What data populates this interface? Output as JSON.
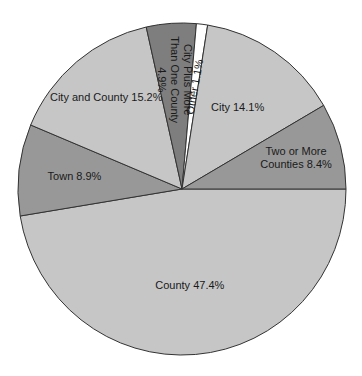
{
  "chart_data": {
    "type": "pie",
    "title": "",
    "categories": [
      "County",
      "Town",
      "City and County",
      "City Plus More Than One County",
      "Other",
      "City",
      "Two or More Counties"
    ],
    "values": [
      47.4,
      8.9,
      15.2,
      4.9,
      1.1,
      14.1,
      8.4
    ],
    "unit": "%",
    "labels": [
      {
        "lines": [
          "County 47.4%"
        ]
      },
      {
        "lines": [
          "Town 8.9%"
        ]
      },
      {
        "lines": [
          "City and County 15.2%"
        ]
      },
      {
        "lines": [
          "City Plus More",
          "Than One County",
          "4.9%"
        ]
      },
      {
        "lines": [
          "Other 1.1%"
        ]
      },
      {
        "lines": [
          "City 14.1%"
        ]
      },
      {
        "lines": [
          "Two or More",
          "Counties 8.4%"
        ]
      }
    ],
    "colors": [
      "#c6c6c6",
      "#989898",
      "#c6c6c6",
      "#7e7e7e",
      "#ffffff",
      "#c6c6c6",
      "#989898"
    ],
    "start_angle_deg": 0,
    "direction": "clockwise-from-3-oclock",
    "legend": "none (labels inside slices)"
  }
}
